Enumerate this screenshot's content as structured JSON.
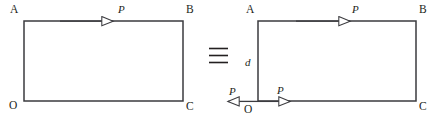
{
  "figure": {
    "width": 442,
    "height": 122,
    "background": "#ffffff",
    "stroke_color": "#3b3b3f",
    "text_color": "#231f20",
    "relation_symbol": "≡",
    "left_diagram": {
      "name": "rectangle-OABC-single-load",
      "rect": {
        "x": 24,
        "y": 21,
        "width": 159,
        "height": 80
      },
      "vertices": [
        {
          "label": "A",
          "position": "top-left"
        },
        {
          "label": "B",
          "position": "top-right"
        },
        {
          "label": "O",
          "position": "bottom-left"
        },
        {
          "label": "C",
          "position": "bottom-right"
        }
      ],
      "arrows": [
        {
          "label": "P",
          "edge": "top",
          "direction": "right"
        }
      ]
    },
    "right_diagram": {
      "name": "rectangle-OABC-equivalent-load-system",
      "rect": {
        "x": 258,
        "y": 21,
        "width": 158,
        "height": 80
      },
      "vertices": [
        {
          "label": "A",
          "position": "top-left"
        },
        {
          "label": "B",
          "position": "top-right"
        },
        {
          "label": "O",
          "position": "bottom-left"
        },
        {
          "label": "C",
          "position": "bottom-right"
        }
      ],
      "arrows": [
        {
          "label": "P",
          "edge": "top",
          "direction": "right"
        },
        {
          "label": "P",
          "edge": "bottom-right-of-origin",
          "direction": "right"
        },
        {
          "label": "P",
          "edge": "bottom-left-of-origin",
          "direction": "left"
        }
      ],
      "dimension_labels": [
        {
          "label": "d",
          "position": "left-side",
          "italic": true
        }
      ]
    }
  }
}
